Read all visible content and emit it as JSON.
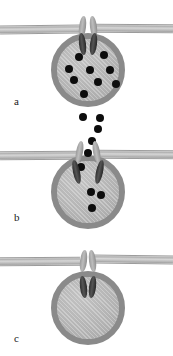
{
  "figure": {
    "caption_labels": [
      "a",
      "b",
      "c"
    ],
    "colors": {
      "membrane": "#bdbdbd",
      "membrane_edge": "#9c9c9c",
      "vesicle_fill": "#b4b4b4",
      "vesicle_border": "#8a8a8a",
      "granule": "#0d0d0d",
      "channel_light": "#a8a8a8",
      "channel_dark": "#2f2f2f",
      "background": "#ffffff"
    }
  },
  "panels": [
    {
      "label": "a",
      "stage_name": "docked-vesicle",
      "membrane_y": 24,
      "vesicle": {
        "cx": 88,
        "cy": 70,
        "r": 37
      },
      "channel": {
        "x": 79,
        "y": 16,
        "w": 18,
        "h": 38
      },
      "granule_radius": 4,
      "granules_inside": [
        {
          "x": 73,
          "y": 55
        },
        {
          "x": 98,
          "y": 53
        },
        {
          "x": 84,
          "y": 68
        },
        {
          "x": 104,
          "y": 68
        },
        {
          "x": 68,
          "y": 78
        },
        {
          "x": 92,
          "y": 80
        },
        {
          "x": 110,
          "y": 82
        },
        {
          "x": 78,
          "y": 92
        },
        {
          "x": 60,
          "y": 69
        }
      ],
      "granules_released": []
    },
    {
      "label": "b",
      "stage_name": "fusion-pore-release",
      "membrane_y": 150,
      "vesicle": {
        "cx": 88,
        "cy": 192,
        "r": 37
      },
      "channel": {
        "x": 76,
        "y": 143,
        "w": 24,
        "h": 36
      },
      "granule_radius": 4,
      "granules_inside": [
        {
          "x": 88,
          "y": 168
        },
        {
          "x": 81,
          "y": 182
        },
        {
          "x": 95,
          "y": 185
        },
        {
          "x": 86,
          "y": 198
        }
      ],
      "granules_released": [
        {
          "x": 83,
          "y": 117
        },
        {
          "x": 100,
          "y": 118
        },
        {
          "x": 98,
          "y": 129
        },
        {
          "x": 92,
          "y": 141
        },
        {
          "x": 88,
          "y": 153
        }
      ]
    },
    {
      "label": "c",
      "stage_name": "empty-vesicle-detached",
      "membrane_y": 256,
      "vesicle": {
        "cx": 88,
        "cy": 308,
        "r": 37
      },
      "channel_membrane": {
        "x": 80,
        "y": 250,
        "w": 16,
        "h": 22
      },
      "channel_vesicle": {
        "x": 80,
        "y": 276,
        "w": 16,
        "h": 22
      },
      "granule_radius": 4,
      "granules_inside": [],
      "granules_released": []
    }
  ]
}
